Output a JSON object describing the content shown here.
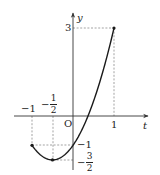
{
  "chart_data": {
    "type": "line",
    "title": "",
    "function": "y = 2t^2 + 2t - 1",
    "xlabel": "t",
    "ylabel": "y",
    "origin_label": "O",
    "domain": [
      -1,
      1
    ],
    "points": [
      {
        "t": -1,
        "y": -1,
        "marker": true
      },
      {
        "t": -0.5,
        "y": -1.5,
        "marker": true
      },
      {
        "t": 1,
        "y": 3,
        "marker": true
      }
    ],
    "x_tick_labels": [
      {
        "value": -1,
        "text": "−1"
      },
      {
        "value": -0.5,
        "text": "−",
        "num": "1",
        "den": "2"
      },
      {
        "value": 1,
        "text": "1"
      }
    ],
    "y_tick_labels": [
      {
        "value": 3,
        "text": "3"
      },
      {
        "value": -1,
        "text": "−1"
      },
      {
        "value": -1.5,
        "text": "−",
        "num": "3",
        "den": "2"
      }
    ],
    "guides": "dashed projection lines from marked points to both axes",
    "grid": false,
    "legend": null,
    "colors": {
      "curve": "#1a1a1a",
      "axis": "#333333",
      "dash": "#555555"
    }
  }
}
